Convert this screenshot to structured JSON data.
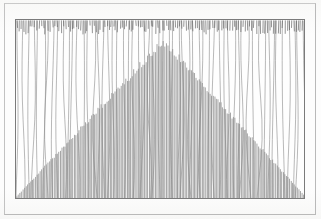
{
  "figure": {
    "title": "",
    "caption": "",
    "medium": "scanned line figure",
    "background_color": "#fdfdfc",
    "frame_color": "#b9b9b9",
    "plot_border_color": "#7b7b7b",
    "line_color": "#6d6d6d"
  },
  "plot_box": {
    "left": 15,
    "top": 19,
    "width": 290,
    "height": 180
  },
  "chart_data": {
    "type": "bar",
    "title": "",
    "subtitle": "",
    "xlabel": "",
    "ylabel": "",
    "xlim": [
      0,
      290
    ],
    "ylim": [
      0,
      180
    ],
    "grid": false,
    "legend": null,
    "annotations": [],
    "tick_labels_x": [],
    "tick_labels_y": [],
    "description": "Dense needle/spike plot: a symmetric triangular envelope of short spikes rising from the baseline peaking near the horizontal centre, overlaid by sparse full-height vertical lines and a dense band of short downward ticks hanging from the top axis.",
    "series": [
      {
        "name": "triangular-envelope-spikes",
        "note": "short spikes drawn upward from the baseline; height follows a symmetric tent peaking at x=147",
        "peak_x": 147,
        "peak_height": 158,
        "baseline_height": 2,
        "count": 186
      },
      {
        "name": "full-height-lines",
        "note": "long vertical lines spanning the full plot height with slight scan-induced waviness",
        "count": 58,
        "height": 180
      },
      {
        "name": "top-band-ticks",
        "note": "dense short ticks hanging down from the top axis, lengths 5 to 14 px",
        "count": 132,
        "min_length": 5,
        "max_length": 14
      }
    ]
  },
  "seeds": {
    "wave": 1337,
    "tick": 4242,
    "ramp": 90210
  }
}
